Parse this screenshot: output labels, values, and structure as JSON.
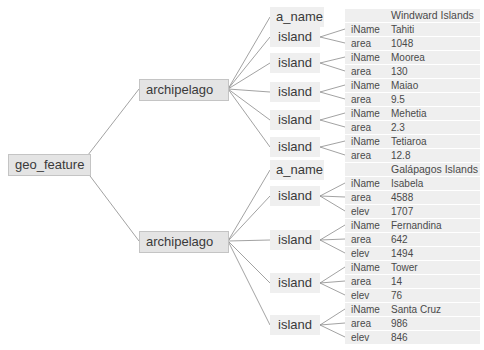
{
  "root": {
    "label": "geo_feature"
  },
  "archipelagos": [
    {
      "label": "archipelago",
      "a_name_label": "a_name",
      "a_name_value": "Windward Islands",
      "islands": [
        {
          "label": "island",
          "fields": [
            {
              "key": "iName",
              "value": "Tahiti"
            },
            {
              "key": "area",
              "value": "1048"
            }
          ]
        },
        {
          "label": "island",
          "fields": [
            {
              "key": "iName",
              "value": "Moorea"
            },
            {
              "key": "area",
              "value": "130"
            }
          ]
        },
        {
          "label": "island",
          "fields": [
            {
              "key": "iName",
              "value": "Maiao"
            },
            {
              "key": "area",
              "value": "9.5"
            }
          ]
        },
        {
          "label": "island",
          "fields": [
            {
              "key": "iName",
              "value": "Mehetia"
            },
            {
              "key": "area",
              "value": "2.3"
            }
          ]
        },
        {
          "label": "island",
          "fields": [
            {
              "key": "iName",
              "value": "Tetiaroa"
            },
            {
              "key": "area",
              "value": "12.8"
            }
          ]
        }
      ]
    },
    {
      "label": "archipelago",
      "a_name_label": "a_name",
      "a_name_value": "Galápagos Islands",
      "islands": [
        {
          "label": "island",
          "fields": [
            {
              "key": "iName",
              "value": "Isabela"
            },
            {
              "key": "area",
              "value": "4588"
            },
            {
              "key": "elev",
              "value": "1707"
            }
          ]
        },
        {
          "label": "island",
          "fields": [
            {
              "key": "iName",
              "value": "Fernandina"
            },
            {
              "key": "area",
              "value": "642"
            },
            {
              "key": "elev",
              "value": "1494"
            }
          ]
        },
        {
          "label": "island",
          "fields": [
            {
              "key": "iName",
              "value": "Tower"
            },
            {
              "key": "area",
              "value": "14"
            },
            {
              "key": "elev",
              "value": "76"
            }
          ]
        },
        {
          "label": "island",
          "fields": [
            {
              "key": "iName",
              "value": "Santa Cruz"
            },
            {
              "key": "area",
              "value": "986"
            },
            {
              "key": "elev",
              "value": "846"
            }
          ]
        }
      ]
    }
  ],
  "colors": {
    "line": "#8a8a8a",
    "node_fill": "#e4e4e4",
    "node_border": "#c4c4c4",
    "row_fill": "#efefef",
    "text": "#3a3a3a"
  }
}
